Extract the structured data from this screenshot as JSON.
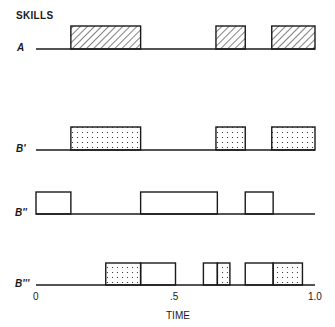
{
  "title": "SKILLS",
  "xlabel": "TIME",
  "ticks": [
    {
      "value": 0,
      "label": "0"
    },
    {
      "value": 0.5,
      "label": ".5"
    },
    {
      "value": 1.0,
      "label": "1.0"
    }
  ],
  "rows": [
    {
      "label": "A",
      "baseline_y": 49,
      "box_height": 23,
      "segments": [
        {
          "start": 0.125,
          "end": 0.375,
          "fill": "hatch"
        },
        {
          "start": 0.645,
          "end": 0.75,
          "fill": "hatch"
        },
        {
          "start": 0.845,
          "end": 1.0,
          "fill": "hatch"
        }
      ]
    },
    {
      "label": "B'",
      "baseline_y": 150,
      "box_height": 23,
      "segments": [
        {
          "start": 0.125,
          "end": 0.375,
          "fill": "dots"
        },
        {
          "start": 0.645,
          "end": 0.75,
          "fill": "dots"
        },
        {
          "start": 0.845,
          "end": 1.0,
          "fill": "dots"
        }
      ]
    },
    {
      "label": "B''",
      "baseline_y": 214,
      "box_height": 22,
      "segments": [
        {
          "start": 0.0,
          "end": 0.125,
          "fill": "none"
        },
        {
          "start": 0.375,
          "end": 0.65,
          "fill": "none"
        },
        {
          "start": 0.75,
          "end": 0.85,
          "fill": "none"
        }
      ]
    },
    {
      "label": "B'''",
      "baseline_y": 285,
      "box_height": 22,
      "segments": [
        {
          "start": 0.25,
          "end": 0.375,
          "fill": "dots"
        },
        {
          "start": 0.375,
          "end": 0.5,
          "fill": "none"
        },
        {
          "start": 0.6,
          "end": 0.65,
          "fill": "none"
        },
        {
          "start": 0.65,
          "end": 0.695,
          "fill": "dots"
        },
        {
          "start": 0.75,
          "end": 0.85,
          "fill": "none"
        },
        {
          "start": 0.85,
          "end": 0.955,
          "fill": "dots"
        }
      ]
    }
  ],
  "chart_data": {
    "type": "timeline",
    "title": "SKILLS",
    "xlabel": "TIME",
    "xlim": [
      0,
      1.0
    ],
    "categories": [
      "A",
      "B'",
      "B''",
      "B'''"
    ],
    "series": [
      {
        "name": "A",
        "intervals": [
          [
            0.125,
            0.375
          ],
          [
            0.645,
            0.75
          ],
          [
            0.845,
            1.0
          ]
        ],
        "pattern": "hatched"
      },
      {
        "name": "B'",
        "intervals": [
          [
            0.125,
            0.375
          ],
          [
            0.645,
            0.75
          ],
          [
            0.845,
            1.0
          ]
        ],
        "pattern": "dotted"
      },
      {
        "name": "B''",
        "intervals": [
          [
            0.0,
            0.125
          ],
          [
            0.375,
            0.65
          ],
          [
            0.75,
            0.85
          ]
        ],
        "pattern": "open"
      },
      {
        "name": "B'''",
        "intervals_dotted": [
          [
            0.25,
            0.375
          ],
          [
            0.65,
            0.695
          ],
          [
            0.85,
            0.955
          ]
        ],
        "intervals_open": [
          [
            0.375,
            0.5
          ],
          [
            0.6,
            0.65
          ],
          [
            0.75,
            0.85
          ]
        ],
        "pattern": "mixed"
      }
    ]
  },
  "colors": {
    "ink": "#1a1a1a",
    "background": "#ffffff"
  }
}
